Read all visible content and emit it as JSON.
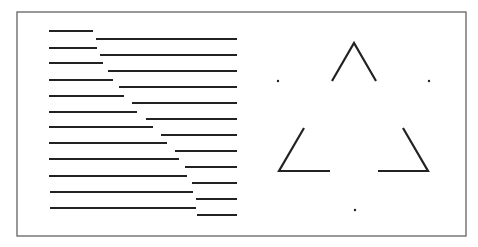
{
  "figure": {
    "frame": {
      "x1": 17,
      "y1": 12,
      "x2": 466,
      "y2": 236,
      "color": "#555555"
    },
    "stroke_color": "#222222",
    "left_panel": {
      "left_segments": [
        {
          "x1": 49,
          "x2": 93,
          "y": 31
        },
        {
          "x1": 49,
          "x2": 97,
          "y": 48
        },
        {
          "x1": 49,
          "x2": 103,
          "y": 63
        },
        {
          "x1": 49,
          "x2": 113,
          "y": 80
        },
        {
          "x1": 49,
          "x2": 124,
          "y": 96
        },
        {
          "x1": 49,
          "x2": 137,
          "y": 112
        },
        {
          "x1": 49,
          "x2": 153,
          "y": 127
        },
        {
          "x1": 49,
          "x2": 167,
          "y": 143
        },
        {
          "x1": 49,
          "x2": 179,
          "y": 159
        },
        {
          "x1": 49,
          "x2": 187,
          "y": 176
        },
        {
          "x1": 50,
          "x2": 193,
          "y": 192
        },
        {
          "x1": 50,
          "x2": 196,
          "y": 208
        }
      ],
      "right_segments": [
        {
          "x1": 96,
          "x2": 237,
          "y": 39
        },
        {
          "x1": 100,
          "x2": 237,
          "y": 55
        },
        {
          "x1": 108,
          "x2": 237,
          "y": 71
        },
        {
          "x1": 119,
          "x2": 237,
          "y": 87
        },
        {
          "x1": 132,
          "x2": 237,
          "y": 103
        },
        {
          "x1": 146,
          "x2": 237,
          "y": 119
        },
        {
          "x1": 161,
          "x2": 237,
          "y": 135
        },
        {
          "x1": 175,
          "x2": 237,
          "y": 151
        },
        {
          "x1": 185,
          "x2": 237,
          "y": 167
        },
        {
          "x1": 192,
          "x2": 237,
          "y": 183
        },
        {
          "x1": 196,
          "x2": 237,
          "y": 199
        },
        {
          "x1": 197,
          "x2": 237,
          "y": 215
        }
      ]
    },
    "right_panel": {
      "corners": [
        {
          "name": "top-corner",
          "points": "332,81 354,43 376,81"
        },
        {
          "name": "bottom-left-corner",
          "points": "304,128 279,171 330,171"
        },
        {
          "name": "bottom-right-corner",
          "points": "403,128 428,171 378,171"
        }
      ],
      "dots": [
        {
          "name": "left-dot",
          "cx": 278,
          "cy": 81
        },
        {
          "name": "right-dot",
          "cx": 429,
          "cy": 81
        },
        {
          "name": "bottom-dot",
          "cx": 355,
          "cy": 210
        }
      ]
    }
  }
}
